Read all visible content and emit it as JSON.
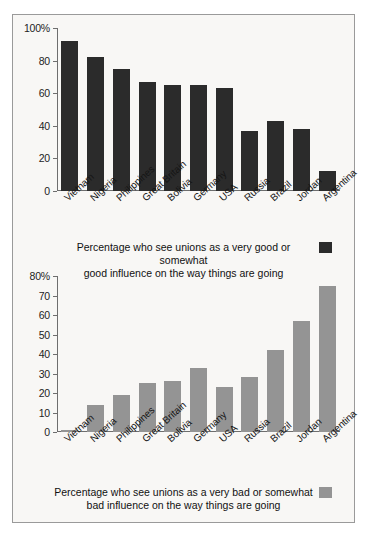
{
  "figure": {
    "background": "#f8f7f5",
    "border_color": "#9a9a9a",
    "dark_color": "#2b2b2b",
    "gray_color": "#949494"
  },
  "chart_data": [
    {
      "type": "bar",
      "id": "good-influence",
      "title": "",
      "xlabel": "",
      "ylabel": "",
      "ylim": [
        0,
        100
      ],
      "yticks": [
        "0",
        "20",
        "40",
        "60",
        "80",
        "100%"
      ],
      "ytick_values": [
        0,
        20,
        40,
        60,
        80,
        100
      ],
      "grid": false,
      "legend_position": "below",
      "legend": "Percentage who see unions as a very good or somewhat good influence on the way things are going",
      "legend_line_1": "Percentage who see unions as a very good or somewhat",
      "legend_line_2": "good influence on the way things are going",
      "color": "#2b2b2b",
      "categories": [
        "Vietnam",
        "Nigeria",
        "Philippines",
        "Great Britain",
        "Bolivia",
        "Germany",
        "USA",
        "Russia",
        "Brazil",
        "Jordan",
        "Argentina"
      ],
      "values": [
        92,
        82,
        75,
        67,
        65,
        65,
        63,
        37,
        43,
        38,
        12
      ]
    },
    {
      "type": "bar",
      "id": "bad-influence",
      "title": "",
      "xlabel": "",
      "ylabel": "",
      "ylim": [
        0,
        80
      ],
      "yticks": [
        "0",
        "10",
        "20",
        "30",
        "40",
        "50",
        "60",
        "70",
        "80%"
      ],
      "ytick_values": [
        0,
        10,
        20,
        30,
        40,
        50,
        60,
        70,
        80
      ],
      "grid": false,
      "legend_position": "below",
      "legend": "Percentage who see unions as a very bad or somewhat bad influence on the way things are going",
      "legend_line_1": "Percentage who see unions as a very bad or somewhat",
      "legend_line_2": "bad influence on the way things are going",
      "color": "#949494",
      "categories": [
        "Vietnam",
        "Nigeria",
        "Philippines",
        "Great Britain",
        "Bolivia",
        "Germany",
        "USA",
        "Russia",
        "Brazil",
        "Jordan",
        "Argentina"
      ],
      "values": [
        1,
        14,
        19,
        25,
        26,
        33,
        23,
        28,
        42,
        57,
        75
      ]
    }
  ]
}
